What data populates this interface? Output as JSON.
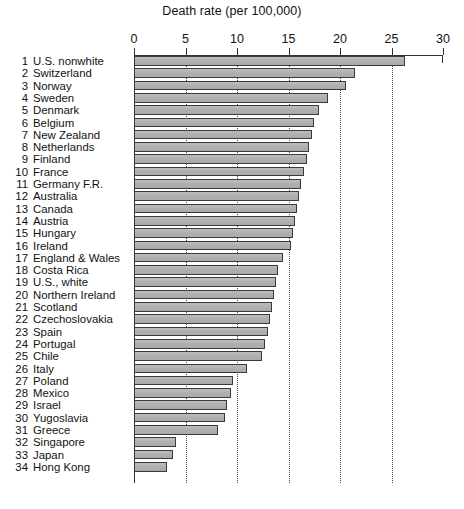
{
  "chart_data": {
    "type": "bar",
    "orientation": "horizontal",
    "title": "Death rate (per 100,000)",
    "xlabel": "Death rate (per 100,000)",
    "ylabel": "",
    "xlim": [
      0,
      30
    ],
    "ticks": [
      0,
      5,
      10,
      15,
      20,
      25,
      30
    ],
    "grid": "vertical dotted at 5,10,15,20,25",
    "legend": "none",
    "bar_color": "#b4b4b4",
    "bar_edge_color": "#3a3a3a",
    "axis_color": "#333333",
    "categories": [
      "U.S. nonwhite",
      "Switzerland",
      "Norway",
      "Sweden",
      "Denmark",
      "Belgium",
      "New Zealand",
      "Netherlands",
      "Finland",
      "France",
      "Germany F.R.",
      "Australia",
      "Canada",
      "Austria",
      "Hungary",
      "Ireland",
      "England & Wales",
      "Costa Rica",
      "U.S., white",
      "Northern Ireland",
      "Scotland",
      "Czechoslovakia",
      "Spain",
      "Portugal",
      "Chile",
      "Italy",
      "Poland",
      "Mexico",
      "Israel",
      "Yugoslavia",
      "Greece",
      "Singapore",
      "Japan",
      "Hong Kong"
    ],
    "ranks": [
      1,
      2,
      3,
      4,
      5,
      6,
      7,
      8,
      9,
      10,
      11,
      12,
      13,
      14,
      15,
      16,
      17,
      18,
      19,
      20,
      21,
      22,
      23,
      24,
      25,
      26,
      27,
      28,
      29,
      30,
      31,
      32,
      33,
      34
    ],
    "values": [
      26.3,
      21.5,
      20.6,
      18.8,
      18.0,
      17.5,
      17.3,
      17.0,
      16.8,
      16.5,
      16.2,
      16.0,
      15.8,
      15.6,
      15.4,
      15.2,
      14.5,
      14.0,
      13.8,
      13.6,
      13.4,
      13.2,
      13.0,
      12.7,
      12.4,
      11.0,
      9.6,
      9.4,
      9.0,
      8.8,
      8.2,
      4.1,
      3.8,
      3.2
    ]
  }
}
